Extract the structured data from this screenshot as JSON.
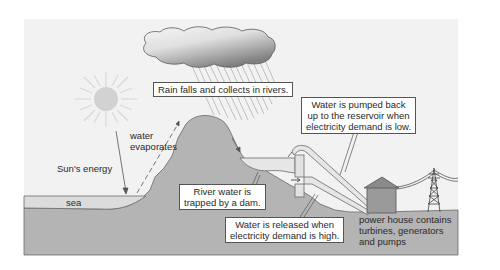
{
  "diagram": {
    "colors": {
      "background": "#f2f2f2",
      "ground": "#b4b4b4",
      "sea": "#dcdcdc",
      "reservoir": "#e4e4e4",
      "sun": "#d4d4d4",
      "cloud_light": "#f0f0f0",
      "cloud_dark": "#8e8e8e",
      "power_house": "#9a9a9a",
      "line": "#555555"
    },
    "labels": {
      "rain": "Rain falls and collects in rivers.",
      "pumped_line1": "Water is pumped back",
      "pumped_line2": "up to the reservoir when",
      "pumped_line3": "electricity demand is low.",
      "evap_line1": "water",
      "evap_line2": "evaporates",
      "sun_energy": "Sun's energy",
      "sea": "sea",
      "dam_line1": "River water is",
      "dam_line2": "trapped by a dam.",
      "released_line1": "Water is released when",
      "released_line2": "electricity demand is high.",
      "powerhouse_line1": "power house contains",
      "powerhouse_line2": "turbines, generators",
      "powerhouse_line3": "and pumps"
    },
    "elements": [
      "sun-icon",
      "cloud-icon",
      "rain-lines",
      "mountain",
      "sea",
      "reservoir",
      "dam",
      "pipes",
      "power-house",
      "pylon-icon",
      "power-lines"
    ]
  }
}
